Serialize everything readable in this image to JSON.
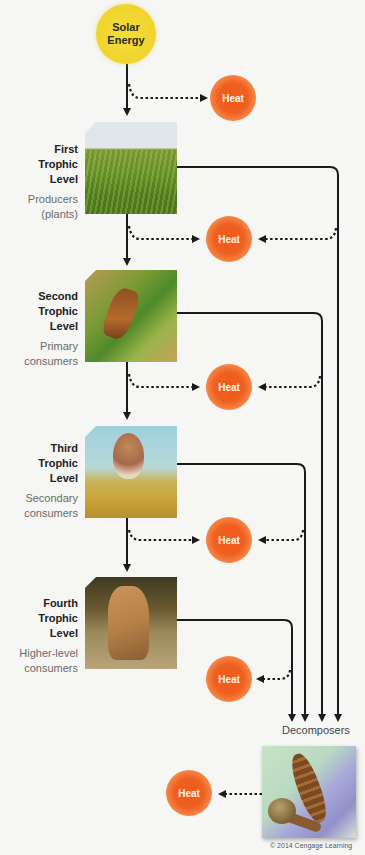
{
  "diagram": {
    "source": {
      "label": "Solar Energy"
    },
    "heat_label": "Heat",
    "levels": [
      {
        "title_line1": "First",
        "title_line2": "Trophic",
        "title_line3": "Level",
        "desc_line1": "Producers",
        "desc_line2": "(plants)",
        "image": "grass-field"
      },
      {
        "title_line1": "Second",
        "title_line2": "Trophic",
        "title_line3": "Level",
        "desc_line1": "Primary",
        "desc_line2": "consumers",
        "image": "grasshopper"
      },
      {
        "title_line1": "Third",
        "title_line2": "Trophic",
        "title_line3": "Level",
        "desc_line1": "Secondary",
        "desc_line2": "consumers",
        "image": "sparrow"
      },
      {
        "title_line1": "Fourth",
        "title_line2": "Trophic",
        "title_line3": "Level",
        "desc_line1": "Higher-level",
        "desc_line2": "consumers",
        "image": "bobcat"
      }
    ],
    "decomposers": {
      "label": "Decomposers",
      "image": "centipede-and-snail"
    },
    "copyright": "© 2014 Cengage Learning",
    "colors": {
      "sun": "#efd42c",
      "heat": "#ee5a1c",
      "line": "#1a1a1a",
      "background": "#f6f6f4"
    }
  }
}
